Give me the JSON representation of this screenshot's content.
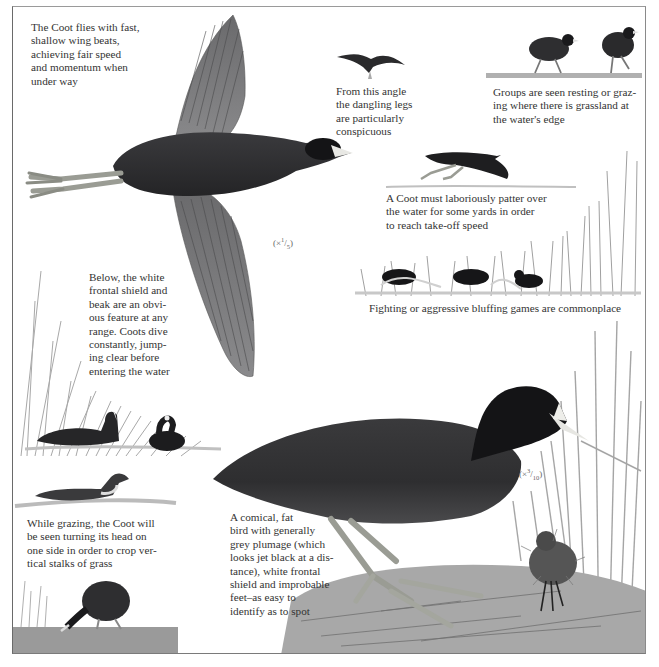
{
  "page": {
    "subject": "Coot",
    "captions": {
      "flight": "The Coot flies with fast,\nshallow wing beats,\nachieving fair speed\nand momentum when\nunder way",
      "dangling_legs": "From this angle\nthe dangling legs\nare particularly\nconspicuous",
      "groups": "Groups are seen resting or graz-\ning where there is grassland at\nthe water's edge",
      "takeoff": "A Coot must laboriously patter over\nthe water for some yards in order\nto reach take-off speed",
      "fighting": "Fighting or aggressive bluffing games are commonplace",
      "below": "Below, the white\nfrontal shield and\nbeak are an obvi-\nous feature at any\nrange. Coots dive\nconstantly, jump-\ning clear before\nentering the water",
      "grazing": "While grazing, the Coot will\nbe seen turning its head on\none side in order to crop ver-\ntical stalks of grass",
      "description": "A comical, fat\nbird with generally\ngrey plumage (which\nlooks jet black at a dis-\ntance), white frontal\nshield and improbable\nfeet–as easy to\nidentify as to spot"
    },
    "scales": {
      "flight": {
        "prefix": "(×",
        "num": "1",
        "den": "5",
        "suffix": ")"
      },
      "standing": {
        "prefix": "(×",
        "num": "3",
        "den": "10",
        "suffix": ")"
      }
    },
    "colors": {
      "plumage": "#2b2b2d",
      "plumage_light": "#4a4a4e",
      "head": "#141416",
      "shield": "#e8e8e4",
      "legs": "#9a9c94",
      "reed": "#9a9a9a",
      "water": "#c9c9c9"
    }
  }
}
